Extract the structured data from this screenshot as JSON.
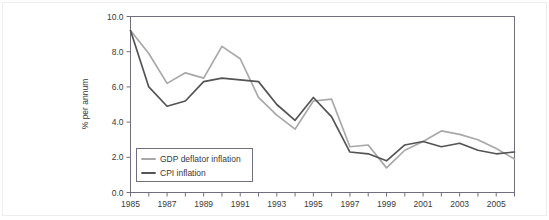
{
  "chart_data": {
    "type": "line",
    "title": "",
    "xlabel": "",
    "ylabel": "% per annum",
    "xlim": [
      1985,
      2006
    ],
    "ylim": [
      0.0,
      10.0
    ],
    "grid": false,
    "legend_position": "bottom-left",
    "x": [
      1985,
      1986,
      1987,
      1988,
      1989,
      1990,
      1991,
      1992,
      1993,
      1994,
      1995,
      1996,
      1997,
      1998,
      1999,
      2000,
      2001,
      2002,
      2003,
      2004,
      2005,
      2006
    ],
    "xticks": [
      1985,
      1987,
      1989,
      1991,
      1993,
      1995,
      1997,
      1999,
      2001,
      2003,
      2005
    ],
    "xtick_labels": [
      "1985",
      "1987",
      "1989",
      "1991",
      "1993",
      "1995",
      "1997",
      "1999",
      "2001",
      "2003",
      "2005"
    ],
    "xticks_minor": [
      1986,
      1988,
      1990,
      1992,
      1994,
      1996,
      1998,
      2000,
      2002,
      2004,
      2006
    ],
    "yticks": [
      0.0,
      2.0,
      4.0,
      6.0,
      8.0,
      10.0
    ],
    "ytick_labels": [
      "0.0",
      "2.0",
      "4.0",
      "6.0",
      "8.0",
      "10.0"
    ],
    "series": [
      {
        "name": "GDP deflator inflation",
        "color": "#a8a8a8",
        "values": [
          9.2,
          7.9,
          6.2,
          6.8,
          6.5,
          8.3,
          7.6,
          5.4,
          4.4,
          3.6,
          5.2,
          5.3,
          2.6,
          2.7,
          1.4,
          2.4,
          2.9,
          3.5,
          3.3,
          3.0,
          2.5,
          1.9
        ]
      },
      {
        "name": "CPI inflation",
        "color": "#545454",
        "values": [
          9.2,
          6.0,
          4.9,
          5.2,
          6.3,
          6.5,
          6.4,
          6.3,
          5.0,
          4.1,
          5.4,
          4.3,
          2.3,
          2.2,
          1.8,
          2.7,
          2.9,
          2.6,
          2.8,
          2.4,
          2.2,
          2.3
        ]
      }
    ]
  },
  "legend": {
    "items": [
      {
        "label": "GDP deflator inflation",
        "color": "#a8a8a8"
      },
      {
        "label": "CPI inflation",
        "color": "#545454"
      }
    ]
  },
  "axes": {
    "y_title": "% per annum"
  },
  "style": {
    "frame_color": "#6f6f80",
    "tick_color": "#6f6f80",
    "text_color": "#3a3a3a",
    "background": "#ffffff"
  }
}
